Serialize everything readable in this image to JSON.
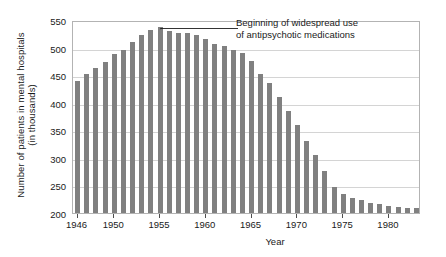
{
  "chart_data": {
    "type": "bar",
    "title": "",
    "subtitle": "",
    "xlabel": "Year",
    "ylabel_line1": "Number of patients in mental hospitals",
    "ylabel_line2": "(in thousands)",
    "ylim": [
      200,
      550
    ],
    "yticks": [
      200,
      250,
      300,
      350,
      400,
      450,
      500,
      550
    ],
    "xticks": [
      1946,
      1950,
      1955,
      1960,
      1965,
      1970,
      1975,
      1980
    ],
    "xlim": [
      1945.5,
      1983.5
    ],
    "grid": "horizontal",
    "legend": "none",
    "bar_color": "#808080",
    "categories": [
      1946,
      1947,
      1948,
      1949,
      1950,
      1951,
      1952,
      1953,
      1954,
      1955,
      1956,
      1957,
      1958,
      1959,
      1960,
      1961,
      1962,
      1963,
      1964,
      1965,
      1966,
      1967,
      1968,
      1969,
      1970,
      1971,
      1972,
      1973,
      1974,
      1975,
      1976,
      1977,
      1978,
      1979,
      1980,
      1981,
      1982,
      1983
    ],
    "values": [
      440,
      453,
      463,
      474,
      488,
      496,
      511,
      523,
      532,
      537,
      530,
      527,
      526,
      523,
      516,
      506,
      502,
      496,
      490,
      476,
      452,
      436,
      410,
      385,
      360,
      330,
      305,
      276,
      247,
      234,
      227,
      224,
      218,
      216,
      213,
      211,
      210,
      209
    ],
    "annotations": [
      {
        "text_line1": "Beginning of widespread use",
        "text_line2": "of antipsychotic medications",
        "points_to_year": 1955,
        "points_to_value": 537
      }
    ]
  },
  "axis": {
    "ytick_labels": [
      "200",
      "250",
      "300",
      "350",
      "400",
      "450",
      "500",
      "550"
    ],
    "xtick_labels": [
      "1946",
      "1950",
      "1955",
      "1960",
      "1965",
      "1970",
      "1975",
      "1980"
    ],
    "x_title": "Year",
    "y_title_line1": "Number of patients in mental hospitals",
    "y_title_line2": "(in thousands)"
  },
  "annotation": {
    "line1": "Beginning of widespread use",
    "line2": "of antipsychotic medications"
  }
}
